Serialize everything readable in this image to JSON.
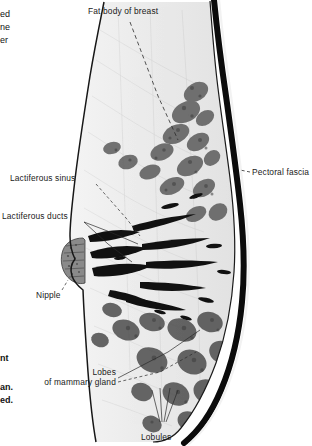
{
  "figure": {
    "background_color": "#ffffff",
    "ink_color": "#1a1a1a"
  },
  "labels": {
    "fat_body": "Fat body of breast",
    "pectoral_fascia": "Pectoral fascia",
    "lactiferous_sinus": "Lactiferous sinus",
    "lactiferous_ducts": "Lactiferous ducts",
    "nipple": "Nipple",
    "lobes_line1": "Lobes",
    "lobes_line2": "of mammary gland",
    "lobules": "Lobules"
  },
  "edge_fragments": {
    "top": [
      "ed",
      "ne",
      "er"
    ],
    "bottom": [
      "nt",
      "an.",
      "ed."
    ]
  },
  "anatomy": {
    "skin_outline_color": "#141414",
    "fascia_color": "#0a0a0a",
    "fat_tissue_color": "#ececec",
    "gland_tissue_color": "#5e5e5e",
    "duct_color": "#101010",
    "nipple_color": "#6a6a6a"
  }
}
